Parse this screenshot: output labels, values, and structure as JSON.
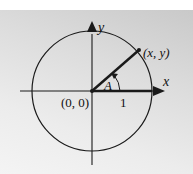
{
  "diagram": {
    "labels": {
      "x_axis": "x",
      "y_axis": "y",
      "origin": "(0, 0)",
      "point": "(x, y)",
      "angle": "A",
      "radius_mark": "1"
    },
    "colors": {
      "stroke": "#1a1a1a",
      "background_top": "#ffffff",
      "background_panel": "#dcdcdc"
    }
  }
}
